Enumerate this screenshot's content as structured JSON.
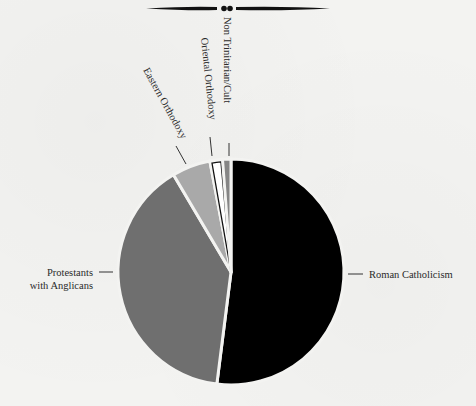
{
  "chart_data": {
    "type": "pie",
    "title": "",
    "start_angle_deg": 0,
    "direction": "clockwise",
    "categories": [
      "Roman Catholicism",
      "Protestants with Anglicans",
      "Eastern Orthodoxy",
      "Oriental Orthodoxy",
      "Non Trinitarian/Cult"
    ],
    "values": [
      52.0,
      39.5,
      5.5,
      1.8,
      1.2
    ],
    "colors": [
      "#000000",
      "#6f6f6f",
      "#a9a9a9",
      "#ffffff",
      "#858585"
    ],
    "outlined": [
      false,
      false,
      false,
      true,
      false
    ],
    "labels": {
      "roman_catholicism": "Roman Catholicism",
      "protestants_line1": "Protestants",
      "protestants_line2": "with Anglicans",
      "eastern_orthodoxy": "Eastern Orthodoxy",
      "oriental_orthodoxy": "Oriental Orthodoxy",
      "non_trinitarian": "Non Trinitarian/Cult"
    },
    "legend": "none (direct labels with leader lines)",
    "grid": false
  },
  "decoration": {
    "divider": "ornamental-rule"
  }
}
